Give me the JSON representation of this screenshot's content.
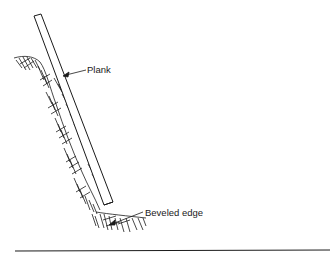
{
  "diagram": {
    "type": "technical-illustration",
    "labels": {
      "plank": "Plank",
      "beveled_edge": "Beveled edge"
    },
    "components": [
      {
        "id": "plank",
        "description": "Long narrow plank leaning against the bank"
      },
      {
        "id": "earth-bank",
        "description": "Hatched earth slope behind the plank"
      },
      {
        "id": "toe",
        "description": "Hatched earth at the plank base"
      },
      {
        "id": "ground-line",
        "description": "Horizontal baseline"
      }
    ],
    "colors": {
      "ink": "#1a1a1a",
      "background": "#ffffff"
    }
  }
}
